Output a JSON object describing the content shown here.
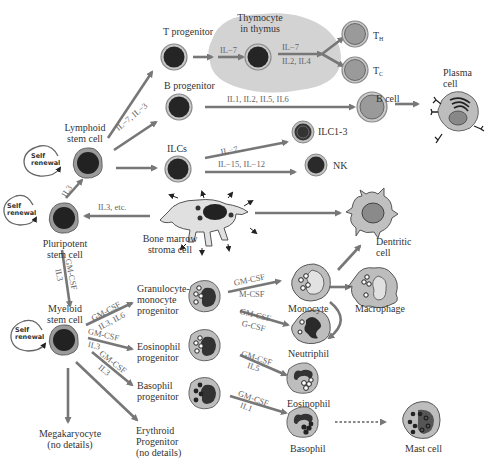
{
  "diagram": {
    "colors": {
      "arrow": "#777777",
      "nucleus": "#2a2a2a",
      "cytoplasm": "#b5b5b5",
      "outer_ring": "#8a8a8a",
      "thymus": "#d0d0d0",
      "text": "#333333",
      "cytokine_text": "#666666"
    },
    "nodes": {
      "pluripotent": {
        "label_line1": "Pluripotent",
        "label_line2": "stem cell",
        "self_renewal_line1": "Self",
        "self_renewal_line2": "renewal"
      },
      "lymphoid": {
        "label_line1": "Lymphoid",
        "label_line2": "stem cell",
        "self_renewal_line1": "Self",
        "self_renewal_line2": "renewal"
      },
      "myeloid": {
        "label_line1": "Myeloid",
        "label_line2": "stem cell",
        "self_renewal_line1": "Self",
        "self_renewal_line2": "renewal"
      },
      "t_progenitor": {
        "label": "T progenitor"
      },
      "thymocyte": {
        "label_line1": "Thymocyte",
        "label_line2": "in thymus"
      },
      "th": {
        "label": "T",
        "sub": "H"
      },
      "tc": {
        "label": "T",
        "sub": "C"
      },
      "b_progenitor": {
        "label": "B progenitor"
      },
      "b_cell": {
        "label": "B cell"
      },
      "plasma_cell": {
        "label_line1": "Plasma",
        "label_line2": "cell"
      },
      "ilcs": {
        "label": "ILCs"
      },
      "ilc13": {
        "label": "ILC1-3"
      },
      "nk": {
        "label": "NK"
      },
      "stroma": {
        "label_line1": "Bone marrow",
        "label_line2": "stroma cell"
      },
      "dendritic": {
        "label_line1": "Dentritic",
        "label_line2": "cell"
      },
      "macrophage": {
        "label": "Macrophage"
      },
      "gm_progenitor": {
        "label_line1": "Granulocyte-",
        "label_line2": "monocyte",
        "label_line3": "progenitor"
      },
      "monocyte": {
        "label": "Monocyte"
      },
      "neutrophil": {
        "label": "Neutriphil"
      },
      "eos_progenitor": {
        "label_line1": "Eosinophil",
        "label_line2": "progenitor"
      },
      "eosinophil": {
        "label": "Eosinophil"
      },
      "baso_progenitor": {
        "label_line1": "Basophil",
        "label_line2": "progenitor"
      },
      "basophil": {
        "label": "Basophil"
      },
      "mast_cell": {
        "label": "Mast cell"
      },
      "megakaryocyte": {
        "label_line1": "Megakaryocyte",
        "label_line2": "(no details)"
      },
      "erythroid": {
        "label_line1": "Erythroid",
        "label_line2": "Progenitor",
        "label_line3": "(no details)"
      }
    },
    "cytokines": {
      "lymphoid_to_b": "IL−7, IL−3",
      "t_to_thymocyte": "IL−7",
      "thymocyte_to_t_1": "IL−7",
      "thymocyte_to_t_2": "IL2, IL4",
      "b_prog_to_b": "IL1, IL2, IL5, IL6",
      "ilcs_to_ilc13": "IL−7...",
      "ilcs_to_nk": "IL−15, IL−12",
      "pluri_to_lymphoid": "IL3",
      "stroma_to_pluri": "IL3, etc.",
      "pluri_to_myeloid_1": "GM-CSF",
      "pluri_to_myeloid_2": "IL3",
      "myeloid_to_gm_1": "GM-CSF",
      "myeloid_to_gm_2": "IL3, IL6",
      "myeloid_to_eos_1": "GM-CSF",
      "myeloid_to_eos_2": "IL3",
      "myeloid_to_baso_1": "GM-CSF",
      "myeloid_to_baso_2": "IL3",
      "gm_to_mono_1": "GM-CSF",
      "gm_to_mono_2": "M-CSF",
      "gm_to_neut_1": "GM-CSF",
      "gm_to_neut_2": "G-CSF",
      "eos_to_eos_1": "GM-CSF",
      "eos_to_eos_2": "IL5",
      "baso_to_baso_1": "GM-CSF",
      "baso_to_baso_2": "IL1"
    }
  }
}
